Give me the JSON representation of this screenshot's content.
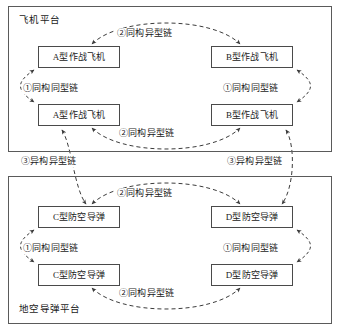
{
  "diagram": {
    "type": "diagram",
    "platforms": [
      {
        "id": "aircraft-platform",
        "title": "飞机平台",
        "nodes": [
          {
            "id": "a-top",
            "label": "A型作战飞机"
          },
          {
            "id": "b-top",
            "label": "B型作战飞机"
          },
          {
            "id": "a-bottom",
            "label": "A型作战飞机"
          },
          {
            "id": "b-bottom",
            "label": "B型作战飞机"
          }
        ],
        "links": [
          {
            "id": "air-top",
            "label": "②同构异型链",
            "style": "dashed",
            "arrows": "both"
          },
          {
            "id": "air-bottom",
            "label": "②同构异型链",
            "style": "dashed",
            "arrows": "both"
          },
          {
            "id": "air-left",
            "label": "①同构同型链",
            "style": "dashed",
            "arrows": "both"
          },
          {
            "id": "air-right",
            "label": "①同构同型链",
            "style": "dashed",
            "arrows": "both"
          }
        ]
      },
      {
        "id": "sam-platform",
        "title": "地空导弹平台",
        "nodes": [
          {
            "id": "c-top",
            "label": "C型防空导弹"
          },
          {
            "id": "d-top",
            "label": "D型防空导弹"
          },
          {
            "id": "c-bottom",
            "label": "C型防空导弹"
          },
          {
            "id": "d-bottom",
            "label": "D型防空导弹"
          }
        ],
        "links": [
          {
            "id": "sam-top",
            "label": "②同构异型链",
            "style": "dashed",
            "arrows": "both"
          },
          {
            "id": "sam-bottom",
            "label": "②同构异型链",
            "style": "dashed",
            "arrows": "both"
          },
          {
            "id": "sam-left",
            "label": "①同构同型链",
            "style": "dashed",
            "arrows": "both"
          },
          {
            "id": "sam-right",
            "label": "①同构同型链",
            "style": "dashed",
            "arrows": "both"
          }
        ]
      }
    ],
    "bridges": [
      {
        "id": "bridge-left",
        "label": "③异构异型链",
        "style": "dashed",
        "arrows": "both"
      },
      {
        "id": "bridge-right",
        "label": "③异构异型链",
        "style": "dashed",
        "arrows": "both"
      }
    ],
    "colors": {
      "frame": "#5a5a5a",
      "node_border": "#4a4a4a",
      "line": "#3c3c3c",
      "text": "#1a1a1a",
      "background": "#ffffff"
    }
  }
}
